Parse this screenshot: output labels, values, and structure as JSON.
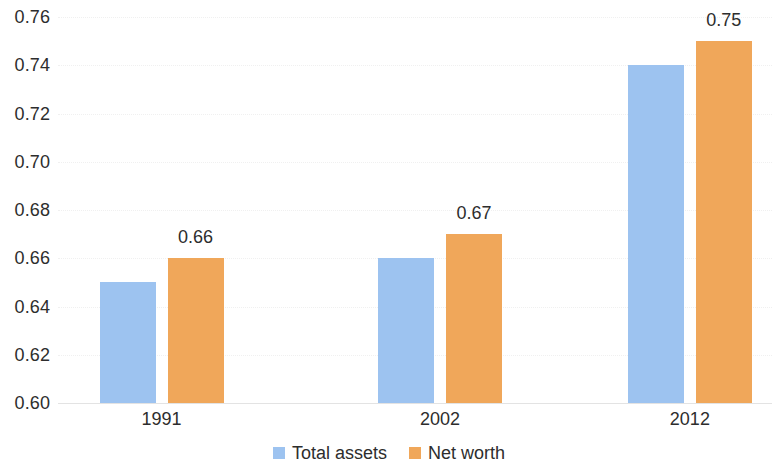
{
  "chart_data": {
    "type": "bar",
    "title": "",
    "subtitle": "",
    "xlabel": "",
    "ylabel": "",
    "categories": [
      "1991",
      "2002",
      "2012"
    ],
    "series": [
      {
        "name": "Total assets",
        "color": "#9DC3F0",
        "values": [
          0.65,
          0.66,
          0.74
        ],
        "labels": [
          "",
          "",
          ""
        ]
      },
      {
        "name": "Net worth",
        "color": "#F0A75A",
        "values": [
          0.66,
          0.67,
          0.75
        ],
        "labels": [
          "0.66",
          "0.67",
          "0.75"
        ]
      }
    ],
    "ylim": [
      0.6,
      0.76
    ],
    "ytick_labels": [
      "0.76",
      "0.74",
      "0.72",
      "0.70",
      "0.68",
      "0.66",
      "0.64",
      "0.62",
      "0.60"
    ],
    "ytick_values": [
      0.76,
      0.74,
      0.72,
      0.7,
      0.68,
      0.66,
      0.64,
      0.62,
      0.6
    ],
    "grid": true,
    "legend_position": "bottom",
    "legend": [
      {
        "label": "Total assets",
        "color": "#9DC3F0"
      },
      {
        "label": "Net worth",
        "color": "#F0A75A"
      }
    ]
  }
}
